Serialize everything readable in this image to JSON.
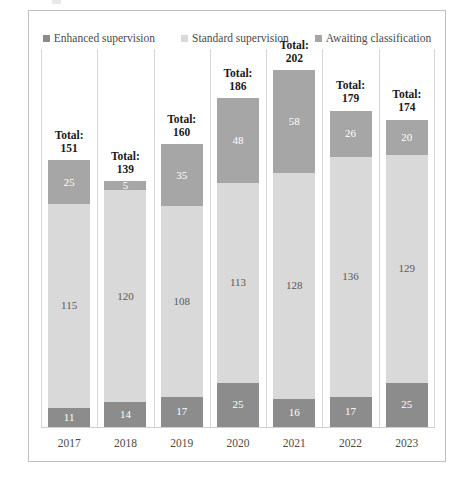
{
  "figure": {
    "title": "",
    "has_border": true
  },
  "legend": {
    "position": "top-center",
    "entries": [
      {
        "label": "Enhanced supervision",
        "color": "#8c8c8c",
        "icon": "square-marker-icon"
      },
      {
        "label": "Standard supervision",
        "color": "#d9d9d9",
        "icon": "square-marker-icon"
      },
      {
        "label": "Awaiting classification",
        "color": "#a6a6a6",
        "icon": "square-marker-icon"
      }
    ]
  },
  "total_word": "Total:",
  "chart_data": {
    "type": "bar",
    "subtype": "stacked-vertical",
    "title": "",
    "xlabel": "",
    "ylabel": "",
    "categories": [
      "2017",
      "2018",
      "2019",
      "2020",
      "2021",
      "2022",
      "2023"
    ],
    "ylim": [
      0,
      202
    ],
    "grid": "vertical-category-separators",
    "legend_position": "top-center",
    "stack_order_bottom_to_top": [
      "Enhanced supervision",
      "Standard supervision",
      "Awaiting classification"
    ],
    "series": [
      {
        "name": "Enhanced supervision",
        "color": "#8c8c8c",
        "values": [
          11,
          14,
          17,
          25,
          16,
          17,
          25
        ]
      },
      {
        "name": "Standard supervision",
        "color": "#d9d9d9",
        "values": [
          115,
          120,
          108,
          113,
          128,
          136,
          129
        ]
      },
      {
        "name": "Awaiting classification",
        "color": "#a6a6a6",
        "values": [
          25,
          5,
          35,
          48,
          58,
          26,
          20
        ]
      }
    ],
    "totals": [
      151,
      139,
      160,
      186,
      202,
      179,
      174
    ],
    "annotations": [
      {
        "category": "2017",
        "text": "Total:\n151"
      },
      {
        "category": "2018",
        "text": "Total:\n139"
      },
      {
        "category": "2019",
        "text": "Total:\n160"
      },
      {
        "category": "2020",
        "text": "Total:\n186"
      },
      {
        "category": "2021",
        "text": "Total:\n202"
      },
      {
        "category": "2022",
        "text": "Total:\n179"
      },
      {
        "category": "2023",
        "text": "Total:\n174"
      }
    ]
  }
}
